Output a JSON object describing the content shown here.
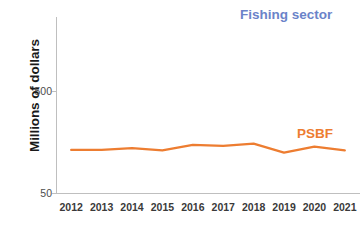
{
  "chart_data": {
    "type": "line",
    "title": "",
    "xlabel": "",
    "ylabel": "Millions of dollars",
    "categories": [
      "2012",
      "2013",
      "2014",
      "2015",
      "2016",
      "2017",
      "2018",
      "2019",
      "2020",
      "2021"
    ],
    "x": [
      2012,
      2013,
      2014,
      2015,
      2016,
      2017,
      2018,
      2019,
      2020,
      2021
    ],
    "ylim": [
      50,
      1400
    ],
    "y_ticks": [
      50,
      500
    ],
    "y_tick_labels": [
      "50",
      "500"
    ],
    "grid": false,
    "legend_position": "in-plot-labels",
    "series": [
      {
        "name": "Fishing sector",
        "color": "#7288cc",
        "values": [
          1190,
          1240,
          1265,
          1240,
          1290,
          1330,
          1365,
          1330,
          1310,
          1345
        ]
      },
      {
        "name": "PSBF",
        "color": "#ed7d31",
        "values": [
          240,
          240,
          248,
          238,
          262,
          258,
          268,
          228,
          255,
          238
        ]
      }
    ],
    "annotations": [
      {
        "text": "Fishing sector",
        "series": "Fishing sector",
        "color": "#6b83c9"
      },
      {
        "text": "PSBF",
        "series": "PSBF",
        "color": "#ed7d31"
      }
    ]
  },
  "axis": {
    "y_title": "Millions of dollars",
    "y_tick_500": "500",
    "y_tick_50": "50"
  },
  "x_labels": [
    "2012",
    "2013",
    "2014",
    "2015",
    "2016",
    "2017",
    "2018",
    "2019",
    "2020",
    "2021"
  ],
  "labels": {
    "fishing_sector": "Fishing sector",
    "psbf": "PSBF"
  },
  "colors": {
    "fishing_sector_line": "#7288cc",
    "fishing_sector_text": "#6b83c9",
    "psbf_line": "#ed7d31",
    "psbf_text": "#ed7d31",
    "axis": "#bfbfbf",
    "tick_text": "#4d4d4d",
    "background": "#ffffff"
  }
}
